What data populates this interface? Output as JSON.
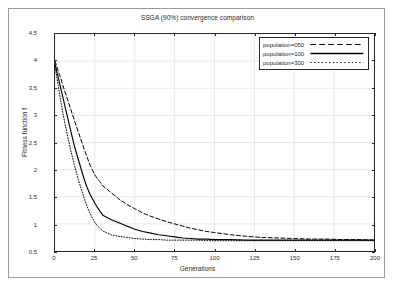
{
  "figure": {
    "caption": ""
  },
  "chart_data": {
    "type": "line",
    "title": "SSGA (90%) convergence comparison",
    "xlabel": "Generations",
    "ylabel": "Fitness function f",
    "xlim": [
      0,
      200
    ],
    "ylim": [
      0.5,
      4.5
    ],
    "xticks": [
      0,
      25,
      50,
      75,
      100,
      125,
      150,
      175,
      200
    ],
    "yticks": [
      0.5,
      1,
      1.5,
      2,
      2.5,
      3,
      3.5,
      4,
      4.5
    ],
    "grid": true,
    "legend_position": "top-right",
    "x": [
      0,
      2,
      4,
      6,
      8,
      10,
      12,
      15,
      18,
      20,
      22,
      25,
      28,
      30,
      35,
      40,
      45,
      50,
      55,
      60,
      65,
      70,
      75,
      80,
      85,
      90,
      95,
      100,
      110,
      120,
      130,
      140,
      150,
      160,
      170,
      180,
      190,
      200
    ],
    "series": [
      {
        "name": "population=050",
        "style": "dashed",
        "color": "#000000",
        "values": [
          4.0,
          3.82,
          3.65,
          3.45,
          3.28,
          3.1,
          2.92,
          2.66,
          2.4,
          2.24,
          2.08,
          1.9,
          1.78,
          1.7,
          1.58,
          1.46,
          1.36,
          1.28,
          1.2,
          1.14,
          1.09,
          1.04,
          1.0,
          0.96,
          0.92,
          0.89,
          0.86,
          0.84,
          0.8,
          0.77,
          0.75,
          0.74,
          0.73,
          0.72,
          0.72,
          0.71,
          0.71,
          0.7
        ]
      },
      {
        "name": "population=100",
        "style": "solid",
        "color": "#000000",
        "values": [
          3.95,
          3.7,
          3.45,
          3.2,
          2.95,
          2.7,
          2.45,
          2.15,
          1.85,
          1.68,
          1.54,
          1.38,
          1.24,
          1.16,
          1.08,
          1.02,
          0.96,
          0.9,
          0.86,
          0.83,
          0.8,
          0.78,
          0.76,
          0.74,
          0.73,
          0.72,
          0.72,
          0.71,
          0.71,
          0.7,
          0.7,
          0.7,
          0.7,
          0.7,
          0.7,
          0.7,
          0.7,
          0.7
        ]
      },
      {
        "name": "population=300",
        "style": "dotted",
        "color": "#000000",
        "values": [
          3.9,
          3.55,
          3.2,
          2.88,
          2.6,
          2.34,
          2.1,
          1.78,
          1.5,
          1.33,
          1.19,
          1.02,
          0.92,
          0.87,
          0.8,
          0.77,
          0.75,
          0.73,
          0.72,
          0.71,
          0.71,
          0.7,
          0.7,
          0.7,
          0.7,
          0.7,
          0.69,
          0.69,
          0.69,
          0.69,
          0.69,
          0.69,
          0.69,
          0.69,
          0.69,
          0.69,
          0.69,
          0.69
        ]
      }
    ]
  }
}
